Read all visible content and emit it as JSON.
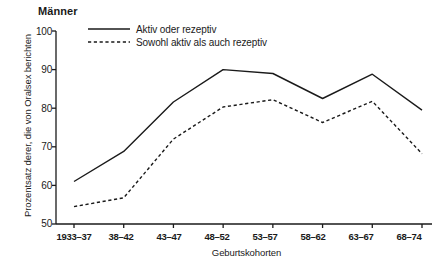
{
  "chart_data": {
    "type": "line",
    "title": "Männer",
    "xlabel": "Geburtskohorten",
    "ylabel": "Prozentsatz derer, die von Oralsex berichten",
    "categories": [
      "1933–37",
      "38–42",
      "43–47",
      "48–52",
      "53–57",
      "58–62",
      "63–67",
      "68–74"
    ],
    "ylim": [
      50,
      100
    ],
    "yticks": [
      "50",
      "60",
      "70",
      "80",
      "90",
      "100"
    ],
    "grid": false,
    "legend_position": "top-left-inside",
    "series": [
      {
        "name": "Aktiv oder rezeptiv",
        "style": "solid",
        "color": "#1a1a1a",
        "values": [
          61.0,
          68.8,
          81.6,
          90.0,
          89.0,
          82.5,
          88.8,
          79.5
        ]
      },
      {
        "name": "Sowohl aktiv als auch rezeptiv",
        "style": "dashed",
        "color": "#1a1a1a",
        "values": [
          54.5,
          56.8,
          72.0,
          80.3,
          82.2,
          76.3,
          81.8,
          68.2
        ]
      }
    ]
  },
  "axis": {
    "tick_color": "#1a1a1a"
  }
}
